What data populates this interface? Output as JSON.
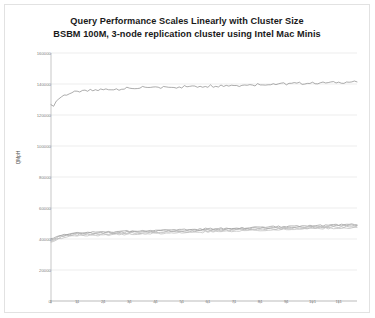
{
  "chart": {
    "title_line1": "Query Performance Scales Linearly with Cluster Size",
    "title_line2": "BSBM 100M, 3-node replication cluster using Intel Mac Minis",
    "ylabel": "QMpH"
  },
  "chart_data": {
    "type": "line",
    "title": "Query Performance Scales Linearly with Cluster Size",
    "subtitle": "BSBM 100M, 3-node replication cluster using Intel Mac Minis",
    "xlabel": "",
    "ylabel": "QMpH",
    "ylim": [
      0,
      160000
    ],
    "xlim": [
      1,
      118
    ],
    "yticks": [
      0,
      20000,
      40000,
      60000,
      80000,
      100000,
      120000,
      140000,
      160000
    ],
    "ytick_labels": [
      "0",
      "20000",
      "40000",
      "60000",
      "80000",
      "100000",
      "120000",
      "140000",
      "160000"
    ],
    "xticks": [
      1,
      11,
      21,
      31,
      41,
      51,
      61,
      71,
      81,
      91,
      101,
      111
    ],
    "xtick_labels": [
      "1",
      "11",
      "21",
      "31",
      "41",
      "51",
      "61",
      "71",
      "81",
      "91",
      "101",
      "111"
    ],
    "grid": true,
    "grid_axis": "y",
    "legend": false,
    "legend_position": "none",
    "line_color": "#808080",
    "series": [
      {
        "name": "3-node cluster aggregate",
        "color": "#7f7f7f",
        "values": [
          126500,
          125800,
          128900,
          130600,
          131800,
          132700,
          133300,
          133900,
          134300,
          134700,
          134900,
          135300,
          135100,
          135600,
          135400,
          135900,
          135700,
          136100,
          136000,
          136400,
          136200,
          136600,
          136400,
          136800,
          136500,
          136900,
          136700,
          137100,
          136800,
          137200,
          137000,
          137400,
          137100,
          137500,
          137200,
          137700,
          137300,
          137800,
          137400,
          137900,
          137500,
          138000,
          137600,
          138100,
          137700,
          138200,
          137800,
          138300,
          137900,
          138400,
          138000,
          138500,
          138100,
          138600,
          138200,
          138700,
          138300,
          138800,
          138400,
          138900,
          138500,
          139000,
          138600,
          139100,
          138700,
          139200,
          138800,
          139300,
          138900,
          139400,
          139000,
          139500,
          139100,
          139600,
          139200,
          139700,
          139300,
          139800,
          139400,
          139900,
          139500,
          140000,
          139600,
          140100,
          139700,
          140200,
          139800,
          140200,
          139900,
          140300,
          140000,
          140400,
          140100,
          140500,
          140200,
          140500,
          140300,
          140600,
          140400,
          140700,
          140500,
          140800,
          140600,
          140800,
          140700,
          140900,
          140800,
          141000,
          140900,
          141100,
          141000,
          141200,
          141100,
          141300,
          141200,
          141400,
          141300,
          141500
        ]
      },
      {
        "name": "node 1",
        "color": "#8c8c8c",
        "values": [
          40200,
          40600,
          41400,
          42100,
          42600,
          42900,
          43200,
          43500,
          43700,
          43900,
          44000,
          44200,
          44100,
          44300,
          44200,
          44400,
          44300,
          44500,
          44400,
          44600,
          44500,
          44700,
          44600,
          44800,
          44700,
          44900,
          44800,
          45000,
          44900,
          45100,
          45000,
          45200,
          45100,
          45300,
          45200,
          45400,
          45300,
          45500,
          45400,
          45600,
          45500,
          45700,
          45600,
          45800,
          45700,
          45900,
          45800,
          46000,
          45900,
          46100,
          46000,
          46200,
          46100,
          46300,
          46200,
          46400,
          46300,
          46500,
          46400,
          46600,
          46500,
          46700,
          46600,
          46800,
          46700,
          46900,
          46800,
          47000,
          46900,
          47100,
          47000,
          47200,
          47100,
          47300,
          47200,
          47400,
          47300,
          47500,
          47400,
          47600,
          47500,
          47700,
          47600,
          47800,
          47700,
          47900,
          47800,
          48000,
          47900,
          48100,
          48000,
          48200,
          48100,
          48300,
          48200,
          48400,
          48300,
          48500,
          48400,
          48600,
          48500,
          48700,
          48600,
          48800,
          48700,
          48900,
          48800,
          49000,
          48900,
          49100,
          49000,
          49200,
          49100,
          49300,
          49200,
          49400,
          49300,
          49500
        ]
      },
      {
        "name": "node 2",
        "color": "#999999",
        "values": [
          39400,
          39900,
          40700,
          41400,
          41900,
          42300,
          42600,
          42900,
          43100,
          43300,
          43400,
          43600,
          43500,
          43700,
          43600,
          43800,
          43700,
          43900,
          43800,
          44000,
          43900,
          44100,
          44000,
          44200,
          44100,
          44300,
          44200,
          44400,
          44300,
          44500,
          44400,
          44600,
          44500,
          44700,
          44600,
          44800,
          44700,
          44900,
          44800,
          45000,
          44900,
          45100,
          45000,
          45200,
          45100,
          45300,
          45200,
          45400,
          45300,
          45500,
          45400,
          45600,
          45500,
          45700,
          45600,
          45800,
          45700,
          45900,
          45800,
          46000,
          45900,
          46100,
          46000,
          46200,
          46100,
          46300,
          46200,
          46400,
          46300,
          46500,
          46400,
          46600,
          46500,
          46700,
          46600,
          46800,
          46700,
          46900,
          46800,
          47000,
          46900,
          47100,
          47000,
          47200,
          47100,
          47300,
          47200,
          47400,
          47300,
          47500,
          47400,
          47600,
          47500,
          47700,
          47600,
          47800,
          47700,
          47900,
          47800,
          48000,
          47900,
          48100,
          48000,
          48200,
          48100,
          48300,
          48200,
          48400,
          48300,
          48500,
          48400,
          48600,
          48500,
          48700,
          48600,
          48800,
          48700,
          48900
        ]
      },
      {
        "name": "node 3",
        "color": "#a6a6a6",
        "values": [
          38700,
          39200,
          40000,
          40700,
          41200,
          41600,
          41900,
          42200,
          42400,
          42600,
          42700,
          42900,
          42800,
          43000,
          42900,
          43100,
          43000,
          43200,
          43100,
          43300,
          43200,
          43400,
          43300,
          43500,
          43400,
          43600,
          43500,
          43700,
          43600,
          43800,
          43700,
          43900,
          43800,
          44000,
          43900,
          44100,
          44000,
          44200,
          44100,
          44300,
          44200,
          44400,
          44300,
          44500,
          44400,
          44600,
          44500,
          44700,
          44600,
          44800,
          44700,
          44900,
          44800,
          45000,
          44900,
          45100,
          45000,
          45200,
          45100,
          45300,
          45200,
          45400,
          45300,
          45500,
          45400,
          45600,
          45500,
          45700,
          45600,
          45800,
          45700,
          45900,
          45800,
          46000,
          45900,
          46100,
          46000,
          46200,
          46100,
          46300,
          46200,
          46400,
          46300,
          46500,
          46400,
          46600,
          46500,
          46700,
          46600,
          46800,
          46700,
          46900,
          46800,
          47000,
          46900,
          47100,
          47000,
          47200,
          47100,
          47300,
          47200,
          47400,
          47300,
          47500,
          47400,
          47600,
          47500,
          47700,
          47600,
          47800,
          47700,
          47900,
          47800,
          48000,
          47900,
          48100,
          48000,
          48200
        ]
      },
      {
        "name": "node 4",
        "color": "#b3b3b3",
        "values": [
          38000,
          38500,
          39300,
          40000,
          40500,
          40900,
          41200,
          41500,
          41700,
          41900,
          42000,
          42200,
          42100,
          42300,
          42200,
          42400,
          42300,
          42500,
          42400,
          42600,
          42500,
          42700,
          42600,
          42800,
          42700,
          42900,
          42800,
          43000,
          42900,
          43100,
          43000,
          43200,
          43100,
          43300,
          43200,
          43400,
          43300,
          43500,
          43400,
          43600,
          43500,
          43700,
          43600,
          43800,
          43700,
          43900,
          43800,
          44000,
          43900,
          44100,
          44000,
          44200,
          44100,
          44300,
          44200,
          44400,
          44300,
          44500,
          44400,
          44600,
          44500,
          44700,
          44600,
          44800,
          44700,
          44900,
          44800,
          45000,
          44900,
          45100,
          45000,
          45200,
          45100,
          45300,
          45200,
          45400,
          45300,
          45500,
          45400,
          45600,
          45500,
          45700,
          45600,
          45800,
          45700,
          45900,
          45800,
          46000,
          45900,
          46100,
          46000,
          46200,
          46100,
          46300,
          46200,
          46400,
          46300,
          46500,
          46400,
          46600,
          46500,
          46700,
          46600,
          46800,
          46700,
          46900,
          46800,
          47000,
          46900,
          47100,
          47000,
          47200,
          47100,
          47300,
          47200,
          47400,
          47300,
          47500
        ]
      }
    ]
  }
}
